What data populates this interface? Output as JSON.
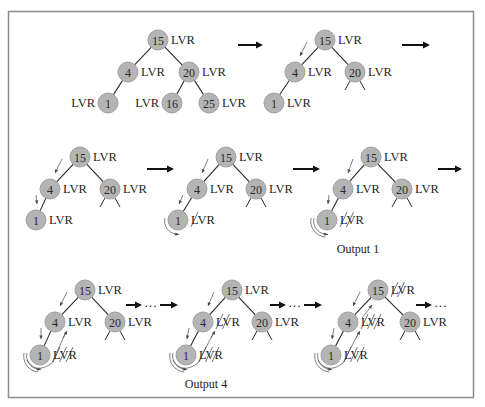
{
  "figure": {
    "label_text": "LVR",
    "tree": {
      "root": "15",
      "left": {
        "value": "4",
        "left": {
          "value": "1"
        }
      },
      "right": {
        "value": "20",
        "left": {
          "value": "16"
        },
        "right": {
          "value": "25"
        }
      }
    },
    "panels": [
      {
        "id": "panel-1",
        "nodes": [
          "15",
          "4",
          "20",
          "1",
          "16",
          "25"
        ],
        "subtree_collapsed": false,
        "struck_lvr": {},
        "caption": ""
      },
      {
        "id": "panel-2",
        "nodes": [
          "15",
          "4",
          "20",
          "1"
        ],
        "subtree_collapsed": true,
        "struck_lvr": {},
        "caption": ""
      },
      {
        "id": "panel-3",
        "nodes": [
          "15",
          "4",
          "20",
          "1"
        ],
        "subtree_collapsed": true,
        "struck_lvr": {},
        "caption": ""
      },
      {
        "id": "panel-4",
        "nodes": [
          "15",
          "4",
          "20",
          "1"
        ],
        "subtree_collapsed": true,
        "struck_lvr": {
          "1": 1
        },
        "caption": ""
      },
      {
        "id": "panel-5",
        "nodes": [
          "15",
          "4",
          "20",
          "1"
        ],
        "subtree_collapsed": true,
        "struck_lvr": {
          "1": 2
        },
        "caption": "Output 1"
      },
      {
        "id": "panel-6",
        "nodes": [
          "15",
          "4",
          "20",
          "1"
        ],
        "subtree_collapsed": true,
        "struck_lvr": {
          "1": 3
        },
        "caption": ""
      },
      {
        "id": "panel-7",
        "nodes": [
          "15",
          "4",
          "20",
          "1"
        ],
        "subtree_collapsed": true,
        "struck_lvr": {
          "1": 3,
          "4": 2
        },
        "caption": "Output 4"
      },
      {
        "id": "panel-8",
        "nodes": [
          "15",
          "4",
          "20",
          "1"
        ],
        "subtree_collapsed": true,
        "struck_lvr": {
          "1": 3,
          "4": 3,
          "15": 2
        },
        "caption": ""
      }
    ],
    "transitions": [
      {
        "from": "panel-1",
        "to": "panel-2",
        "style": "arrow"
      },
      {
        "from": "panel-2",
        "to": "panel-3",
        "style": "arrow"
      },
      {
        "from": "panel-3",
        "to": "panel-4",
        "style": "arrow"
      },
      {
        "from": "panel-4",
        "to": "panel-5",
        "style": "arrow"
      },
      {
        "from": "panel-5",
        "to": "panel-6",
        "style": "arrow"
      },
      {
        "from": "panel-6",
        "to": "panel-7",
        "style": "arrow-dots-arrow"
      },
      {
        "from": "panel-7",
        "to": "panel-8",
        "style": "arrow-dots-arrow"
      },
      {
        "from": "panel-8",
        "to": "end",
        "style": "arrow-dots"
      }
    ],
    "dots_text": "···",
    "colors": {
      "node_fill": "#b4b4b4",
      "frame": "#8c8c8c",
      "ink": "#1f1f1f"
    }
  }
}
